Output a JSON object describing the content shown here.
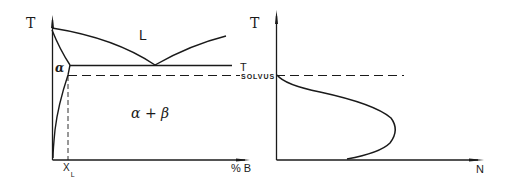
{
  "diagrams": [
    {
      "id": "phase-diagram",
      "title": "",
      "y_axis_label": "T",
      "x_axis_label": "% B",
      "x_marker": {
        "main": "X",
        "sub": "L"
      },
      "regions": [
        "L",
        "α",
        "α + β"
      ],
      "lines": {
        "eutectic_label": "T",
        "solvus_label": "SOLVUS"
      }
    },
    {
      "id": "nucleation-curve",
      "y_axis_label": "T",
      "x_axis_label": "N"
    }
  ],
  "labels": {
    "left_T": "T",
    "region_L": "L",
    "region_alpha": "α",
    "region_alpha_beta": "α + β",
    "xl_main": "X",
    "xl_sub": "L",
    "x_axis_left": "% B",
    "t_solvus_T": "T",
    "t_solvus_sub": "SOLVUS",
    "right_T": "T",
    "x_axis_right": "N"
  },
  "colors": {
    "ink": "#1a1a1a",
    "background": "#ffffff"
  }
}
